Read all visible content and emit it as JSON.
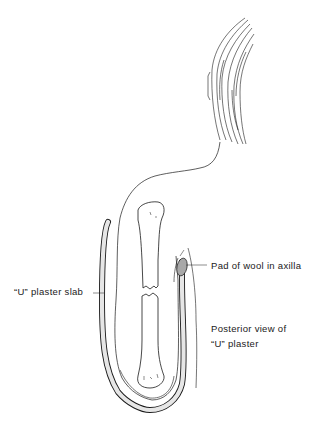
{
  "figure": {
    "labels": {
      "slab": "“U” plaster slab",
      "pad": "Pad of wool in axilla",
      "posterior_line1": "Posterior view of",
      "posterior_line2": "“U” plaster"
    },
    "colors": {
      "line": "#1a1a1a",
      "plaster_fill": "#e6e6e6",
      "pad_fill": "#a8a8a8",
      "background": "#ffffff"
    }
  }
}
